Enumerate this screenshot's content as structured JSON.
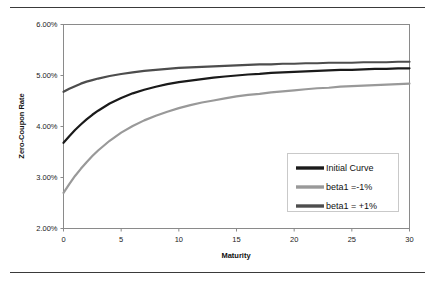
{
  "chart_data": {
    "type": "line",
    "title": "",
    "xlabel": "Maturity",
    "ylabel": "Zero-Coupon Rate",
    "xlim": [
      0,
      30
    ],
    "ylim": [
      0.02,
      0.06
    ],
    "grid": true,
    "legend_position": "inside-bottom-right",
    "x_ticks": [
      0,
      5,
      10,
      15,
      20,
      25,
      30
    ],
    "x_tick_labels": [
      "0",
      "5",
      "10",
      "15",
      "20",
      "25",
      "30"
    ],
    "y_ticks": [
      0.02,
      0.03,
      0.04,
      0.05,
      0.06
    ],
    "y_tick_labels": [
      "2.00%",
      "3.00%",
      "4.00%",
      "5.00%",
      "6.00%"
    ],
    "x": [
      0,
      0.5,
      1,
      1.5,
      2,
      2.5,
      3,
      4,
      5,
      6,
      7,
      8,
      9,
      10,
      11,
      12,
      13,
      14,
      15,
      16,
      17,
      18,
      19,
      20,
      21,
      22,
      23,
      24,
      25,
      26,
      27,
      28,
      29,
      30
    ],
    "series": [
      {
        "name": "Initial Curve",
        "color": "#1a1a1a",
        "width": 2.2,
        "values": [
          0.0368,
          0.0381,
          0.0393,
          0.0404,
          0.0414,
          0.0423,
          0.0431,
          0.0445,
          0.0456,
          0.0465,
          0.0472,
          0.0478,
          0.0483,
          0.0487,
          0.049,
          0.0493,
          0.0496,
          0.0498,
          0.05,
          0.0502,
          0.0503,
          0.0505,
          0.0506,
          0.0507,
          0.0508,
          0.0509,
          0.051,
          0.0511,
          0.0511,
          0.0512,
          0.0513,
          0.0513,
          0.0514,
          0.0514
        ]
      },
      {
        "name": "beta1 =-1%",
        "color": "#999999",
        "width": 2.2,
        "values": [
          0.027,
          0.0287,
          0.0303,
          0.0317,
          0.033,
          0.0342,
          0.0353,
          0.0372,
          0.0388,
          0.0401,
          0.0412,
          0.0421,
          0.0429,
          0.0436,
          0.0442,
          0.0447,
          0.0451,
          0.0455,
          0.0459,
          0.0462,
          0.0464,
          0.0467,
          0.0469,
          0.0471,
          0.0473,
          0.0475,
          0.0476,
          0.0478,
          0.0479,
          0.048,
          0.0481,
          0.0482,
          0.0483,
          0.0484
        ]
      },
      {
        "name": "beta1 = +1%",
        "color": "#4d4d4d",
        "width": 2.2,
        "values": [
          0.0468,
          0.0474,
          0.0479,
          0.0484,
          0.0488,
          0.0491,
          0.0494,
          0.0499,
          0.0503,
          0.0506,
          0.0509,
          0.0511,
          0.0513,
          0.0515,
          0.0516,
          0.0517,
          0.0518,
          0.0519,
          0.052,
          0.0521,
          0.0522,
          0.0522,
          0.0523,
          0.0523,
          0.0524,
          0.0524,
          0.0525,
          0.0525,
          0.0525,
          0.0526,
          0.0526,
          0.0526,
          0.0527,
          0.0527
        ]
      }
    ]
  }
}
